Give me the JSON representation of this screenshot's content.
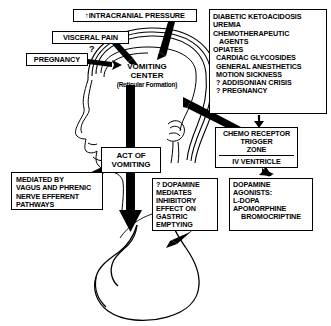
{
  "diagram": {
    "stroke_color": "#000000",
    "background_color": "#ffffff"
  },
  "boxes": {
    "intracranial_pressure": {
      "label": "↑INTRACRANIAL PRESSURE"
    },
    "visceral_pain": {
      "label": "VISCERAL PAIN"
    },
    "pregnancy": {
      "label": "PREGNANCY",
      "marker": "?"
    },
    "vomiting_center": {
      "line1": "VOMITING",
      "line2": "CENTER",
      "subtitle": "(Reticular Formation)"
    },
    "emetic_stimuli": {
      "items": [
        "DIABETIC KETOACIDOSIS",
        "UREMIA",
        "CHEMOTHERAPEUTIC",
        "AGENTS",
        "OPIATES",
        "CARDIAC GLYCOSIDES",
        "GENERAL ANESTHETICS",
        "MOTION SICKNESS",
        "? ADDISONIAN CRISIS",
        "? PREGNANCY"
      ]
    },
    "chemoreceptor_trigger_zone": {
      "line1": "CHEMO RECEPTOR",
      "line2": "TRIGGER",
      "line3": "ZONE",
      "ventricle": "IV VENTRICLE"
    },
    "act_of_vomiting": {
      "line1": "ACT OF",
      "line2": "VOMITING"
    },
    "mediated_by": {
      "items": [
        "MEDIATED BY",
        "VAGUS and PHRENIC",
        "NERVE EFFERENT",
        "PATHWAYS"
      ]
    },
    "dopamine_mediates": {
      "items": [
        "? DOPAMINE",
        "MEDIATES",
        "INHIBITORY",
        "EFFECT ON",
        "GASTRIC",
        "EMPTYING"
      ]
    },
    "dopamine_agonists": {
      "items": [
        "DOPAMINE",
        "AGONISTS:",
        "L-DOPA",
        "APOMORPHINE",
        "BROMOCRIPTINE"
      ]
    }
  },
  "illustrations": {
    "head_profile": "head-profile-outline",
    "brain": "brain-outline",
    "stomach": "stomach-outline"
  },
  "arrows": [
    {
      "name": "icp-to-vomiting-center",
      "from": "intracranial_pressure",
      "to": "vomiting_center"
    },
    {
      "name": "visceral-pain-to-vomiting-center",
      "from": "visceral_pain",
      "to": "vomiting_center"
    },
    {
      "name": "pregnancy-to-vomiting-center",
      "from": "pregnancy",
      "to": "vomiting_center"
    },
    {
      "name": "emetic-stimuli-to-ctz",
      "from": "emetic_stimuli",
      "to": "chemoreceptor_trigger_zone"
    },
    {
      "name": "ctz-to-vomiting-center",
      "from": "chemoreceptor_trigger_zone",
      "to": "vomiting_center"
    },
    {
      "name": "mediated-by-to-act-of-vomiting",
      "from": "mediated_by",
      "to": "act_of_vomiting"
    },
    {
      "name": "act-of-vomiting-to-stomach",
      "from": "act_of_vomiting",
      "to": "stomach"
    },
    {
      "name": "dopamine-agonists-to-ctz",
      "from": "dopamine_agonists",
      "to": "chemoreceptor_trigger_zone"
    },
    {
      "name": "dopamine-mediates-to-stomach",
      "from": "dopamine_mediates",
      "to": "stomach"
    }
  ]
}
